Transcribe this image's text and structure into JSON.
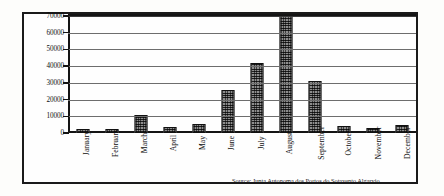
{
  "chart_data": {
    "type": "bar",
    "title": "",
    "subtitle": "",
    "xlabel": "",
    "ylabel": "",
    "ylim": [
      0,
      70000
    ],
    "yticks": [
      0,
      10000,
      20000,
      30000,
      40000,
      50000,
      60000,
      70000
    ],
    "ytick_labels": [
      "0",
      "10000",
      "20000",
      "30000",
      "40000",
      "50000",
      "60000",
      "70000"
    ],
    "grid": true,
    "legend": "none",
    "categories": [
      "January",
      "February",
      "March",
      "April",
      "May",
      "June",
      "July",
      "August",
      "September",
      "October",
      "November",
      "December"
    ],
    "values": [
      2600,
      2200,
      10500,
      3700,
      5300,
      25500,
      42000,
      70000,
      31000,
      4200,
      2800,
      4800
    ],
    "series": [
      {
        "name": "Monthly value",
        "values": [
          2600,
          2200,
          10500,
          3700,
          5300,
          25500,
          42000,
          70000,
          31000,
          4200,
          2800,
          4800
        ]
      }
    ],
    "annotations": [
      "Source: Junta Autonoma dos Portos do Sotavento Algarvio"
    ]
  },
  "figure": {
    "source_note": "Source: Junta Autonoma dos Portos do Sotavento Algarvio"
  },
  "colors": {
    "bar_fill": "#8e8e8e",
    "bar_edge": "#111111",
    "axis": "#141414",
    "gridline": "#6d6d6d",
    "frame": "#1a1a1a",
    "background": "#fefefe",
    "text": "#111111"
  }
}
